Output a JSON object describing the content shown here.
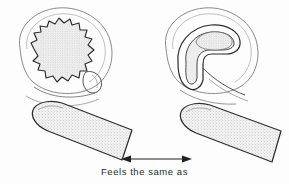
{
  "figure": {
    "caption": "Feels the same as",
    "panels": [
      {
        "id": "left-panel",
        "name": "bumpy-round-object-panel",
        "object_label": "bumpy round object",
        "outline_label": "oval boundary outline",
        "finger_label": "stippled fingertip"
      },
      {
        "id": "right-panel",
        "name": "curved-hook-object-panel",
        "object_label": "curved crescent hook object",
        "outline_label": "oval boundary outline",
        "finger_label": "stippled fingertip"
      }
    ],
    "connector": {
      "type": "double-headed-arrow",
      "label": "Feels the same as"
    },
    "colors": {
      "background": "#fdfdfd",
      "ink": "#2b2b2b",
      "ink_light": "#8d8d8d",
      "fill": "#ededed",
      "stipple": "#9a9a9a",
      "text": "#2c2c2c"
    }
  }
}
